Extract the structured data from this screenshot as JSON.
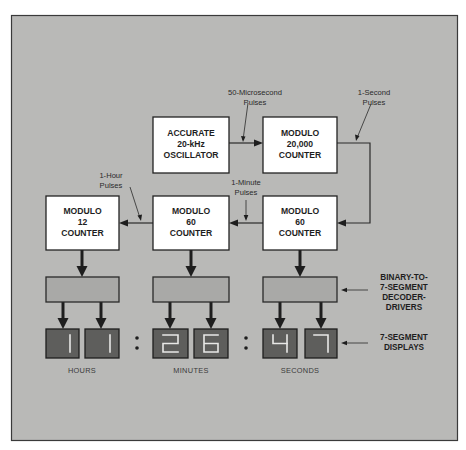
{
  "diagram": {
    "colors": {
      "background": "#b9b9b7",
      "block_fill": "#ffffff",
      "decoder_fill": "#a9a9a7",
      "display_fill": "#5e5e5c",
      "segment": "#e8e8e6"
    },
    "blocks": {
      "oscillator": {
        "line1": "ACCURATE",
        "line2": "20-kHz",
        "line3": "OSCILLATOR"
      },
      "mod20000": {
        "line1": "MODULO",
        "line2": "20,000",
        "line3": "COUNTER"
      },
      "mod60_seconds": {
        "line1": "MODULO",
        "line2": "60",
        "line3": "COUNTER"
      },
      "mod60_minutes": {
        "line1": "MODULO",
        "line2": "60",
        "line3": "COUNTER"
      },
      "mod12_hours": {
        "line1": "MODULO",
        "line2": "12",
        "line3": "COUNTER"
      }
    },
    "annotations": {
      "microsecond_pulses": {
        "line1": "50-Microsecond",
        "line2": "Pulses"
      },
      "second_pulses": {
        "line1": "1-Second",
        "line2": "Pulses"
      },
      "minute_pulses": {
        "line1": "1-Minute",
        "line2": "Pulses"
      },
      "hour_pulses": {
        "line1": "1-Hour",
        "line2": "Pulses"
      }
    },
    "side_labels": {
      "decoder": {
        "line1": "BINARY-TO-",
        "line2": "7-SEGMENT",
        "line3": "DECODER-",
        "line4": "DRIVERS"
      },
      "displays": {
        "line1": "7-SEGMENT",
        "line2": "DISPLAYS"
      }
    },
    "display": {
      "digits": [
        "1",
        "1",
        "2",
        "6",
        "4",
        "7"
      ],
      "separator": ":",
      "time": "11:26:47",
      "units": {
        "hours": "HOURS",
        "minutes": "MINUTES",
        "seconds": "SECONDS"
      }
    }
  }
}
